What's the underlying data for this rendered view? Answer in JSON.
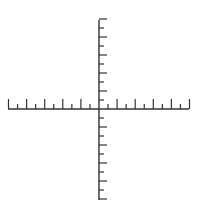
{
  "diagram": {
    "title": "",
    "type": "coordinate-axes",
    "stroke_color": "#333333",
    "background": "#ffffff",
    "x_axis": {
      "y": 109,
      "x_start": 8,
      "x_end": 189,
      "origin_x": 99,
      "tick_spacing": 9.05,
      "ticks_per_side": 10,
      "long_tick_length": 10,
      "short_tick_length": 5,
      "tick_direction": "up",
      "labels": []
    },
    "y_axis": {
      "x": 99,
      "y_start": 20,
      "y_end": 200,
      "origin_y": 109,
      "tick_spacing": 9.0,
      "ticks_above": 10,
      "ticks_below": 10,
      "long_tick_length": 8,
      "short_tick_length": 5,
      "tick_direction": "right",
      "labels": []
    }
  }
}
